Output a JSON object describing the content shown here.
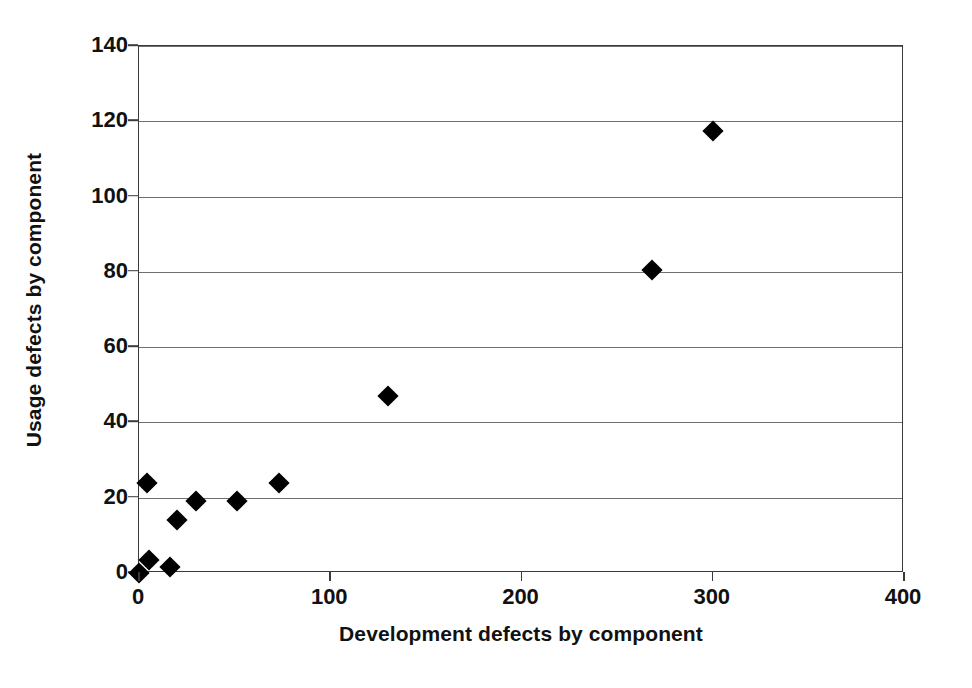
{
  "chart_data": {
    "type": "scatter",
    "title": "",
    "xlabel": "Development defects by component",
    "ylabel": "Usage defects by component",
    "xlim": [
      0,
      400
    ],
    "ylim": [
      0,
      140
    ],
    "xticks": [
      0,
      100,
      200,
      300,
      400
    ],
    "yticks": [
      0,
      20,
      40,
      60,
      80,
      100,
      120,
      140
    ],
    "grid": "horizontal",
    "legend": "none",
    "marker": "filled-diamond",
    "marker_color": "#000000",
    "series": [
      {
        "name": "components",
        "points": [
          {
            "x": 0,
            "y": 0
          },
          {
            "x": 4,
            "y": 24
          },
          {
            "x": 5,
            "y": 3.5
          },
          {
            "x": 16,
            "y": 1.5
          },
          {
            "x": 20,
            "y": 14
          },
          {
            "x": 30,
            "y": 19
          },
          {
            "x": 51,
            "y": 19
          },
          {
            "x": 73,
            "y": 24
          },
          {
            "x": 130,
            "y": 47
          },
          {
            "x": 268,
            "y": 80.5
          },
          {
            "x": 300,
            "y": 117.5
          }
        ]
      }
    ]
  }
}
